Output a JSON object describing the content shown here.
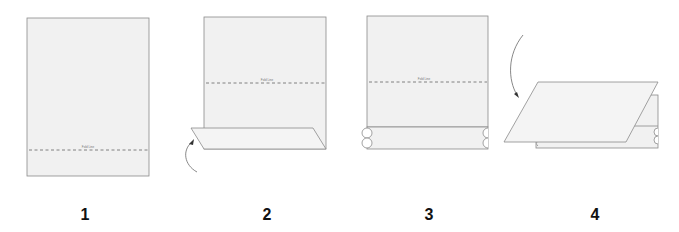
{
  "diagram": {
    "type": "paper folding instructions",
    "fold_line_label": "Fold Line",
    "steps": [
      {
        "number": "1",
        "description": "Flat sheet with fold line near bottom"
      },
      {
        "number": "2",
        "description": "Bottom flap folded up along fold line"
      },
      {
        "number": "3",
        "description": "Bottom edge rolled, fold line in middle"
      },
      {
        "number": "4",
        "description": "Top half folded down over rolled edge"
      }
    ]
  },
  "colors": {
    "paper_fill": "#f1f1f1",
    "outline": "#8a8a8a",
    "number_text": "#111111"
  }
}
